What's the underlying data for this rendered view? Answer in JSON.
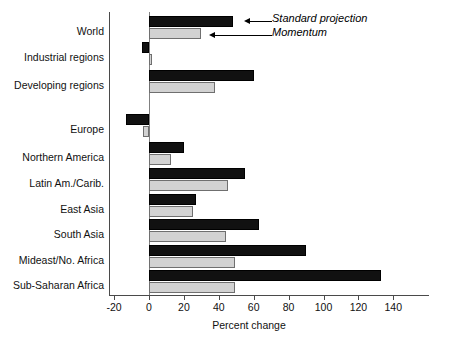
{
  "chart_data": {
    "type": "bar",
    "orientation": "horizontal",
    "title": "",
    "xlabel": "Percent change",
    "ylabel": "",
    "xlim": [
      -20,
      140
    ],
    "xticks": [
      -20,
      0,
      20,
      40,
      60,
      80,
      100,
      120,
      140
    ],
    "xtick_labels": [
      "-20",
      "0",
      "20",
      "40",
      "60",
      "80",
      "100",
      "120",
      "140"
    ],
    "grid": false,
    "legend_position": "annotation-arrows-top-right",
    "categories": [
      "World",
      "Industrial regions",
      "Developing regions",
      "Europe",
      "Northern America",
      "Latin Am./Carib.",
      "East Asia",
      "South Asia",
      "Mideast/No. Africa",
      "Sub-Saharan Africa"
    ],
    "series": [
      {
        "name": "Standard projection",
        "color": "#111111",
        "values": [
          48,
          -4,
          60,
          -13,
          20,
          55,
          27,
          63,
          90,
          133
        ]
      },
      {
        "name": "Momentum",
        "color": "#d2d2d2",
        "values": [
          30,
          1.5,
          38,
          -3.5,
          12.5,
          45,
          25.5,
          44,
          49.5,
          49
        ]
      }
    ],
    "annotations": [
      {
        "label": "Standard projection",
        "points_to": "World standard projection bar"
      },
      {
        "label": "Momentum",
        "points_to": "World momentum bar"
      }
    ]
  },
  "axis": {
    "x_label": "Percent change",
    "tick_labels": [
      "-20",
      "0",
      "20",
      "40",
      "60",
      "80",
      "100",
      "120",
      "140"
    ]
  },
  "annotations": {
    "standard": "Standard projection",
    "momentum": "Momentum"
  },
  "categories": [
    "World",
    "Industrial regions",
    "Developing regions",
    "Europe",
    "Northern America",
    "Latin Am./Carib.",
    "East Asia",
    "South Asia",
    "Mideast/No. Africa",
    "Sub-Saharan Africa"
  ]
}
